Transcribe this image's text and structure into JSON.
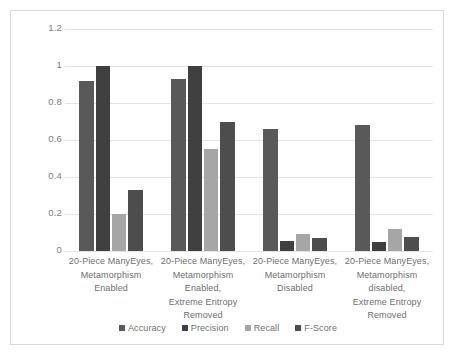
{
  "chart_data": {
    "type": "bar",
    "title": "",
    "xlabel": "",
    "ylabel": "",
    "ylim": [
      0,
      1.2
    ],
    "yticks": [
      "0",
      "0.2",
      "0.4",
      "0.6",
      "0.8",
      "1",
      "1.2"
    ],
    "ytick_values": [
      0,
      0.2,
      0.4,
      0.6,
      0.8,
      1,
      1.2
    ],
    "grid": true,
    "legend_position": "bottom",
    "categories": [
      "20-Piece ManyEyes, Metamorphism Enabled",
      "20-Piece ManyEyes, Metamorphism Enabled, Extreme Entropy Removed",
      "20-Piece ManyEyes, Metamorphism Disabled",
      "20-Piece ManyEyes, Metamorphism disabled, Extreme Entropy Removed"
    ],
    "category_lines": [
      [
        "20-Piece ManyEyes,",
        "Metamorphism Enabled"
      ],
      [
        "20-Piece ManyEyes,",
        "Metamorphism Enabled,",
        "Extreme Entropy",
        "Removed"
      ],
      [
        "20-Piece ManyEyes,",
        "Metamorphism Disabled"
      ],
      [
        "20-Piece ManyEyes,",
        "Metamorphism disabled,",
        "Extreme Entropy",
        "Removed"
      ]
    ],
    "series": [
      {
        "name": "Accuracy",
        "color": "#595959",
        "values": [
          0.92,
          0.93,
          0.66,
          0.68
        ]
      },
      {
        "name": "Precision",
        "color": "#404040",
        "values": [
          1.0,
          1.0,
          0.055,
          0.05
        ]
      },
      {
        "name": "Recall",
        "color": "#a6a6a6",
        "values": [
          0.2,
          0.55,
          0.09,
          0.12
        ]
      },
      {
        "name": "F-Score",
        "color": "#4d4d4d",
        "values": [
          0.33,
          0.7,
          0.07,
          0.075
        ]
      }
    ]
  },
  "style": {
    "border_color": "#d9d9d9",
    "gridline_color": "#e4e4e4",
    "text_color": "#6f6f6f",
    "background": "#ffffff"
  }
}
